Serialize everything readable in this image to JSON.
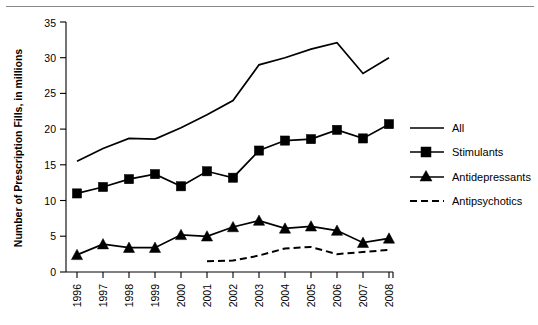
{
  "chart_data": {
    "type": "line",
    "title": "",
    "xlabel": "",
    "ylabel": "Number of Prescription Fills, in millions",
    "categories": [
      "1996",
      "1997",
      "1998",
      "1999",
      "2000",
      "2001",
      "2002",
      "2003",
      "2004",
      "2005",
      "2006",
      "2007",
      "2008"
    ],
    "ylim": [
      0,
      35
    ],
    "yticks": [
      0,
      5,
      10,
      15,
      20,
      25,
      30,
      35
    ],
    "grid": false,
    "legend_position": "right",
    "series": [
      {
        "name": "All",
        "marker": "none",
        "style": "solid",
        "values": [
          15.5,
          17.3,
          18.7,
          18.6,
          20.2,
          22.0,
          24.0,
          29.0,
          30.0,
          31.2,
          32.1,
          27.8,
          30.0
        ]
      },
      {
        "name": "Stimulants",
        "marker": "square",
        "style": "solid",
        "values": [
          11.0,
          11.9,
          13.0,
          13.7,
          12.0,
          14.1,
          13.2,
          17.0,
          18.4,
          18.6,
          19.9,
          18.7,
          20.7
        ]
      },
      {
        "name": "Antidepressants",
        "marker": "triangle",
        "style": "solid",
        "values": [
          2.4,
          3.9,
          3.4,
          3.4,
          5.2,
          5.0,
          6.3,
          7.2,
          6.1,
          6.4,
          5.8,
          4.1,
          4.7
        ]
      },
      {
        "name": "Antipsychotics",
        "marker": "none",
        "style": "dashed",
        "values": [
          null,
          null,
          null,
          null,
          null,
          1.5,
          1.6,
          2.3,
          3.3,
          3.5,
          2.5,
          2.8,
          3.1
        ]
      }
    ]
  },
  "legend": {
    "items": [
      {
        "label": "All"
      },
      {
        "label": "Stimulants"
      },
      {
        "label": "Antidepressants"
      },
      {
        "label": "Antipsychotics"
      }
    ]
  },
  "axes": {
    "y_title": "Number of Prescription Fills, in millions",
    "y_tick_labels": [
      "0",
      "5",
      "10",
      "15",
      "20",
      "25",
      "30",
      "35"
    ],
    "x_tick_labels": [
      "1996",
      "1997",
      "1998",
      "1999",
      "2000",
      "2001",
      "2002",
      "2003",
      "2004",
      "2005",
      "2006",
      "2007",
      "2008"
    ]
  },
  "colors": {
    "ink": "#000000",
    "rule": "#8a8a8a",
    "background": "#ffffff"
  }
}
